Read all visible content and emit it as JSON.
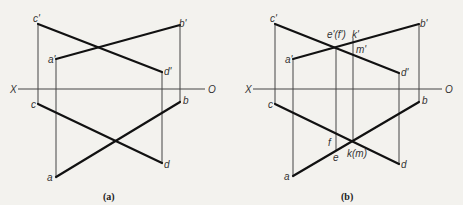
{
  "figure": {
    "panels": [
      {
        "caption": "(a)",
        "axis": {
          "left_label": "X",
          "right_label": "O"
        },
        "points": {
          "c_prime": "c'",
          "a_prime": "a'",
          "d_prime": "d'",
          "b_prime": "b'",
          "c": "c",
          "b": "b",
          "d": "d",
          "a": "a"
        }
      },
      {
        "caption": "(b)",
        "axis": {
          "left_label": "X",
          "right_label": "O"
        },
        "points": {
          "c_prime": "c'",
          "a_prime": "a'",
          "d_prime": "d'",
          "b_prime": "b'",
          "c": "c",
          "b": "b",
          "d": "d",
          "a": "a",
          "e_prime_f_prime": "e'(f')",
          "k_prime": "k'",
          "m_prime": "m'",
          "f": "f",
          "e": "e",
          "k_m": "k(m)"
        }
      }
    ]
  }
}
